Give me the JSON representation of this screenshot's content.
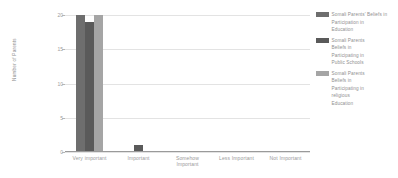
{
  "chart_data": {
    "type": "bar",
    "title": "",
    "xlabel": "",
    "ylabel": "Number of Parents",
    "ylim": [
      0,
      20
    ],
    "yticks": [
      0,
      5,
      10,
      15,
      20
    ],
    "grid": true,
    "legend_position": "right",
    "categories": [
      "Very important",
      "Important",
      "Somehow\nImportant",
      "Less Important",
      "Not Important"
    ],
    "series": [
      {
        "name": "Somali Parents' Beliefs in\nParticipation in\nEducation",
        "color": "#6e6e6e",
        "values": [
          20,
          0,
          0,
          0,
          0
        ]
      },
      {
        "name": "Somali Parents\nBeliefs in\nParticipating in\nPublic Schools",
        "color": "#5a5a5a",
        "values": [
          19,
          1,
          0,
          0,
          0
        ]
      },
      {
        "name": "Somali Parents\nBeliefs in\nParticipating in\nreligious\nEducation",
        "color": "#a5a5a5",
        "values": [
          20,
          0,
          0,
          0,
          0
        ]
      }
    ]
  },
  "colors": {
    "background": "#ffffff",
    "gridline": "#e3e3e3",
    "axis": "#9a9a9a",
    "tick_text": "#9d9d9d",
    "label_text": "#9a9a9a",
    "legend_text": "#8f8f8f"
  }
}
